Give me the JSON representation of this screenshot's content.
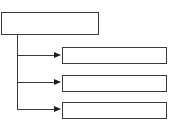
{
  "diagram": {
    "type": "tree",
    "colors": {
      "stroke": "#3a3a3a",
      "arrow": "#1e1e1e",
      "fill": "#ffffff"
    },
    "root": {
      "label": ""
    },
    "children": [
      {
        "label": ""
      },
      {
        "label": ""
      },
      {
        "label": ""
      }
    ]
  }
}
